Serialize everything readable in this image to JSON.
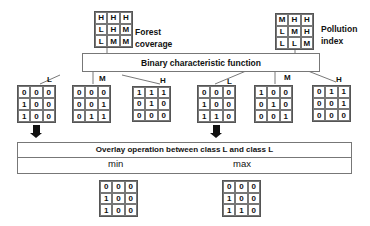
{
  "inputs": {
    "forest": {
      "label_line1": "Forest",
      "label_line2": "coverage",
      "cells": [
        "H",
        "H",
        "H",
        "L",
        "H",
        "M",
        "L",
        "M",
        "M"
      ]
    },
    "pollution": {
      "label_line1": "Pollution",
      "label_line2": "index",
      "cells": [
        "M",
        "H",
        "H",
        "L",
        "M",
        "H",
        "L",
        "L",
        "M"
      ]
    }
  },
  "bcf_box": {
    "title": "Binary characteristic function"
  },
  "forest_classes": [
    {
      "label": "L",
      "cells": [
        "0",
        "0",
        "0",
        "1",
        "0",
        "0",
        "1",
        "0",
        "0"
      ]
    },
    {
      "label": "M",
      "cells": [
        "0",
        "0",
        "0",
        "0",
        "0",
        "1",
        "0",
        "1",
        "1"
      ]
    },
    {
      "label": "H",
      "cells": [
        "1",
        "1",
        "1",
        "0",
        "1",
        "0",
        "0",
        "0",
        "0"
      ]
    }
  ],
  "pollution_classes": [
    {
      "label": "L",
      "cells": [
        "0",
        "0",
        "0",
        "1",
        "0",
        "0",
        "1",
        "1",
        "0"
      ]
    },
    {
      "label": "M",
      "cells": [
        "1",
        "0",
        "0",
        "0",
        "1",
        "0",
        "0",
        "0",
        "1"
      ]
    },
    {
      "label": "H",
      "cells": [
        "0",
        "1",
        "1",
        "0",
        "0",
        "1",
        "0",
        "0",
        "0"
      ]
    }
  ],
  "overlay_box": {
    "title": "Overlay operation between class L and class L",
    "min_label": "min",
    "max_label": "max"
  },
  "results": {
    "min": {
      "cells": [
        "0",
        "0",
        "0",
        "1",
        "0",
        "0",
        "1",
        "0",
        "0"
      ]
    },
    "max": {
      "cells": [
        "0",
        "0",
        "0",
        "1",
        "0",
        "0",
        "1",
        "1",
        "0"
      ]
    }
  }
}
